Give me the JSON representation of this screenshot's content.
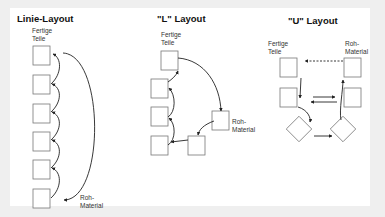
{
  "diagrams": [
    {
      "title": "Linie-Layout",
      "start_label": "Fertige\nTeile",
      "end_label": "Roh-\nMaterial"
    },
    {
      "title": "\"L\" Layout",
      "start_label": "Fertige\nTeile",
      "end_label": "Roh-\nMaterial"
    },
    {
      "title": "\"U\" Layout",
      "start_label": "Fertige\nTeile",
      "end_label": "Roh-\nMaterial"
    }
  ],
  "colors": {
    "background": "#efefef",
    "panel": "#ffffff",
    "stroke": "#222222",
    "box_stroke": "#777777"
  }
}
